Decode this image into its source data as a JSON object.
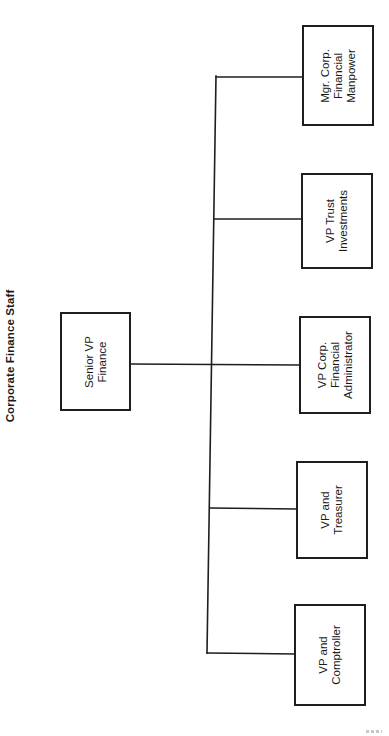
{
  "title": "Corporate Finance Staff",
  "colors": {
    "line": "#1e1e1e",
    "background": "#ffffff",
    "text": "#1a1a1a"
  },
  "root": {
    "id": "senior-vp-finance",
    "lines": [
      "Senior VP",
      "Finance"
    ]
  },
  "children": [
    {
      "id": "mgr-corp-financial-manpower",
      "lines": [
        "Mgr. Corp.",
        "Financial",
        "Manpower"
      ]
    },
    {
      "id": "vp-trust-investments",
      "lines": [
        "VP Trust",
        "Investments"
      ]
    },
    {
      "id": "vp-corp-financial-administrator",
      "lines": [
        "VP Corp.",
        "Financial",
        "Administrator"
      ]
    },
    {
      "id": "vp-and-treasurer",
      "lines": [
        "VP and",
        "Treasurer"
      ]
    },
    {
      "id": "vp-and-comptroller",
      "lines": [
        "VP and",
        "Comptroller"
      ]
    }
  ]
}
